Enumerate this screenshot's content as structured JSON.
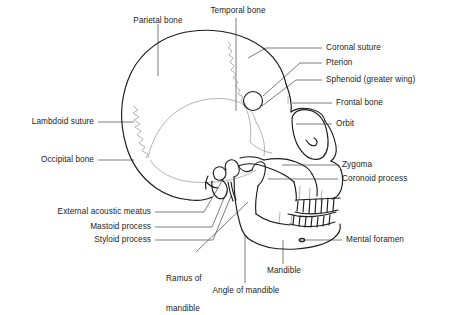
{
  "figure": {
    "type": "anatomical-diagram",
    "line_color": "#1b1b1b",
    "suture_color": "#8a8a8a",
    "leader_color": "#6e6e6e",
    "background": "#ffffff"
  },
  "labels": {
    "parietal_bone": "Parietal bone",
    "temporal_bone": "Temporal bone",
    "coronal_suture": "Coronal suture",
    "pterion": "Pterion",
    "sphenoid": "Sphenoid (greater wing)",
    "frontal_bone": "Frontal bone",
    "orbit": "Orbit",
    "lambdoid_suture": "Lambdoid suture",
    "occipital_bone": "Occipital bone",
    "zygoma": "Zygoma",
    "coronoid_process": "Coronoid process",
    "external_acoustic_meatus": "External acoustic meatus",
    "mastoid_process": "Mastoid process",
    "styloid_process": "Styloid process",
    "ramus_of_mandible_line1": "Ramus of",
    "ramus_of_mandible_line2": "mandible",
    "mental_foramen": "Mental foramen",
    "mandible": "Mandible",
    "angle_of_mandible": "Angle of mandible"
  }
}
